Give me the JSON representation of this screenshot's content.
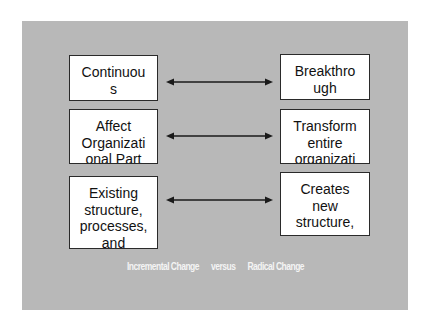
{
  "slide": {
    "background_color": "#b8b8b8",
    "box_color": "#ffffff",
    "border_color": "#2a2a2a",
    "caption_color": "#f4f4f4"
  },
  "left_column": {
    "title": "Incremental Change",
    "items": [
      {
        "lines": [
          "Continuou",
          "s"
        ]
      },
      {
        "lines": [
          "Affect",
          "Organizati",
          "onal Part"
        ]
      },
      {
        "lines": [
          "Existing",
          "structure,",
          "processes,",
          "and"
        ]
      }
    ]
  },
  "right_column": {
    "title": "Radical Change",
    "items": [
      {
        "lines": [
          "Breakthro",
          "ugh"
        ]
      },
      {
        "lines": [
          "Transform",
          "entire",
          "organizati"
        ]
      },
      {
        "lines": [
          "Creates",
          "new",
          "structure,"
        ]
      }
    ]
  },
  "arrows": [
    {
      "type": "double-headed",
      "label": "row-1"
    },
    {
      "type": "double-headed",
      "label": "row-2"
    },
    {
      "type": "double-headed",
      "label": "row-3"
    }
  ],
  "caption": {
    "left": "Incremental Change",
    "middle": "versus",
    "right": "Radical Change"
  }
}
